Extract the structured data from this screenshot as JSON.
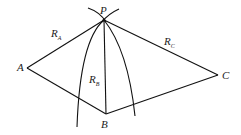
{
  "diagram": {
    "points": {
      "P": {
        "label": "P",
        "x": 104,
        "y": 20
      },
      "A": {
        "label": "A",
        "x": 27,
        "y": 68
      },
      "B": {
        "label": "B",
        "x": 106,
        "y": 114
      },
      "C": {
        "label": "C",
        "x": 218,
        "y": 75
      }
    },
    "segments": [
      {
        "from": "P",
        "to": "A",
        "label": "R",
        "sub": "A"
      },
      {
        "from": "P",
        "to": "B",
        "label": "R",
        "sub": "B"
      },
      {
        "from": "P",
        "to": "C",
        "label": "R",
        "sub": "C"
      },
      {
        "from": "A",
        "to": "B",
        "label": ""
      },
      {
        "from": "B",
        "to": "C",
        "label": ""
      }
    ],
    "labels": {
      "P": "P",
      "A": "A",
      "B": "B",
      "C": "C",
      "RA": "R",
      "RA_sub": "A",
      "RB": "R",
      "RB_sub": "B",
      "RC": "R",
      "RC_sub": "C"
    }
  }
}
